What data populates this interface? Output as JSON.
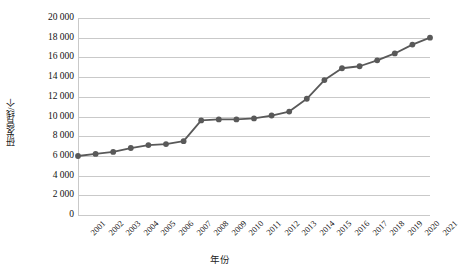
{
  "chart_data": {
    "type": "line",
    "title": "",
    "xlabel": "年份",
    "ylabel": "研发管线/个",
    "categories": [
      "2001",
      "2002",
      "2003",
      "2004",
      "2005",
      "2006",
      "2007",
      "2008",
      "2009",
      "2010",
      "2011",
      "2012",
      "2013",
      "2014",
      "2015",
      "2016",
      "2017",
      "2018",
      "2019",
      "2020",
      "2021"
    ],
    "series": [
      {
        "name": "研发管线",
        "values": [
          5990,
          6200,
          6400,
          6800,
          7100,
          7200,
          7500,
          9600,
          9700,
          9700,
          9800,
          10100,
          10500,
          11800,
          13700,
          14900,
          15100,
          15700,
          16400,
          17300,
          18000
        ]
      }
    ],
    "ylim": [
      0,
      20000
    ],
    "ytick_values": [
      0,
      2000,
      4000,
      6000,
      8000,
      10000,
      12000,
      14000,
      16000,
      18000,
      20000
    ],
    "ytick_labels": [
      "0",
      "2 000",
      "4 000",
      "6 000",
      "8 000",
      "10 000",
      "12 000",
      "14 000",
      "16 000",
      "18 000",
      "20 000"
    ],
    "grid": true,
    "legend": false,
    "legend_position": "none",
    "line_color": "#595959",
    "marker_color": "#595959",
    "gridline_color": "#c9c9c9"
  }
}
